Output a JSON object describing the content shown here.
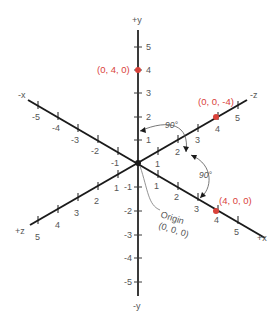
{
  "diagram": {
    "origin": {
      "label": "Origin",
      "coords": "(0, 0, 0)"
    },
    "axes": {
      "y_pos_label": "+y",
      "y_neg_label": "-y",
      "x_pos_label": "+x",
      "x_neg_label": "-x",
      "z_pos_label": "+z",
      "z_neg_label": "-z"
    },
    "y_ticks": [
      "5",
      "4",
      "3",
      "2",
      "1",
      "-1",
      "-2",
      "-3",
      "-4",
      "-5"
    ],
    "x_pos_ticks": [
      "1",
      "2",
      "3",
      "4",
      "5"
    ],
    "x_neg_ticks": [
      "-1",
      "-2",
      "-3",
      "-4",
      "-5"
    ],
    "z_pos_ticks": [
      "1",
      "2",
      "3",
      "4",
      "5"
    ],
    "z_neg_ticks": [
      "1",
      "2",
      "3",
      "4",
      "5"
    ],
    "points": [
      {
        "label": "(0, 4, 0)",
        "color": "#d9423a"
      },
      {
        "label": "(0, 0, -4)",
        "color": "#d9423a"
      },
      {
        "label": "(4, 0, 0)",
        "color": "#d9423a"
      }
    ],
    "angles": [
      "90°",
      "90°"
    ],
    "colors": {
      "axis": "#1a1a1a",
      "point": "#d9423a",
      "text": "#555555"
    }
  }
}
